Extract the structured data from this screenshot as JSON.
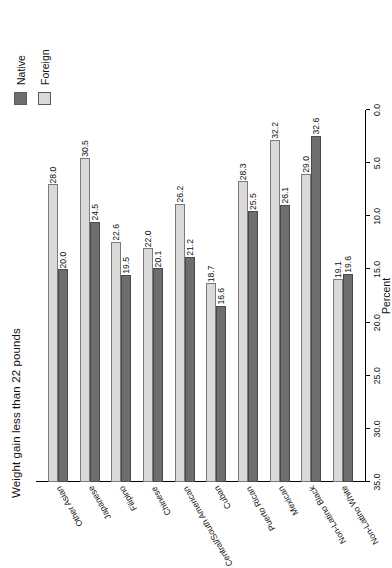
{
  "chart_data": {
    "type": "bar",
    "orientation": "horizontal",
    "title": "Weight gain less than 22 pounds",
    "xlabel": "Percent",
    "ylabel": "",
    "xlim": [
      0,
      35
    ],
    "axis_reversed": true,
    "grid": false,
    "legend_position": "top-left",
    "tick_labels": [
      "35.0",
      "30.0",
      "25.0",
      "20.0",
      "15.0",
      "10.0",
      "5.0",
      "0.0"
    ],
    "ticks": [
      35.0,
      30.0,
      25.0,
      20.0,
      15.0,
      10.0,
      5.0,
      0.0
    ],
    "categories": [
      "Non-Latino White",
      "Non-Latino Black",
      "Mexican",
      "Puerto Rican",
      "Cuban",
      "Central/South American",
      "Chinese",
      "Filipino",
      "Japanese",
      "Other Asian"
    ],
    "series": [
      {
        "name": "Native",
        "color": "#6e6e6e",
        "values": [
          19.6,
          32.6,
          26.1,
          25.5,
          16.6,
          21.2,
          20.1,
          19.5,
          24.5,
          20.0
        ],
        "labels": [
          "19.6",
          "32.6",
          "26.1",
          "25.5",
          "16.6",
          "21.2",
          "20.1",
          "19.5",
          "24.5",
          "20.0"
        ]
      },
      {
        "name": "Foreign",
        "color": "#d9d9d9",
        "values": [
          19.1,
          29.0,
          32.2,
          28.3,
          18.7,
          26.2,
          22.0,
          22.6,
          30.5,
          28.0
        ],
        "labels": [
          "19.1",
          "29.0",
          "32.2",
          "28.3",
          "18.7",
          "26.2",
          "22.0",
          "22.6",
          "30.5",
          "28.0"
        ]
      }
    ]
  },
  "legend": {
    "items": [
      {
        "label": "Native"
      },
      {
        "label": "Foreign"
      }
    ]
  }
}
